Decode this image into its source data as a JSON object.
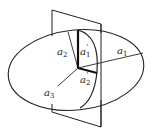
{
  "diagram": {
    "stroke_color": "#222222",
    "background": "#ffffff",
    "labels": {
      "a1": {
        "base": "a",
        "sub": "1",
        "prime": ""
      },
      "a2": {
        "base": "a",
        "sub": "2",
        "prime": ""
      },
      "a3": {
        "base": "a",
        "sub": "3",
        "prime": ""
      },
      "a1p": {
        "base": "a",
        "sub": "1",
        "prime": "'"
      },
      "a2p": {
        "base": "a",
        "sub": "2",
        "prime": "'"
      }
    }
  }
}
